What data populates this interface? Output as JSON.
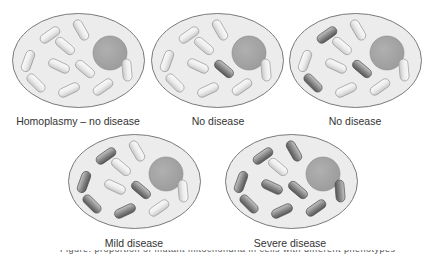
{
  "colors": {
    "cytoplasm": "#ececec",
    "membrane": "#7a7a7a",
    "nucleus": "#9a9a9a",
    "normal_mito": "#ededed",
    "mutant_mito": "#8a8a8a"
  },
  "mito_layout": [
    {
      "cx": 38,
      "cy": 22,
      "angle": -35
    },
    {
      "cx": 69,
      "cy": 17,
      "angle": 60
    },
    {
      "cx": 53,
      "cy": 33,
      "angle": 40
    },
    {
      "cx": 16,
      "cy": 48,
      "angle": -70
    },
    {
      "cx": 47,
      "cy": 53,
      "angle": 25
    },
    {
      "cx": 73,
      "cy": 56,
      "angle": 40
    },
    {
      "cx": 24,
      "cy": 70,
      "angle": 45
    },
    {
      "cx": 57,
      "cy": 77,
      "angle": -25
    },
    {
      "cx": 91,
      "cy": 74,
      "angle": -35
    },
    {
      "cx": 115,
      "cy": 57,
      "angle": 85
    }
  ],
  "cells": [
    {
      "id": "cell-1",
      "x": 12,
      "y": 13,
      "label": "Homoplasmy – no disease",
      "label_x": 78,
      "label_y": 115,
      "mutant": []
    },
    {
      "id": "cell-2",
      "x": 151,
      "y": 13,
      "label": "No disease",
      "label_x": 218,
      "label_y": 115,
      "mutant": [
        5
      ]
    },
    {
      "id": "cell-3",
      "x": 289,
      "y": 13,
      "label": "No disease",
      "label_x": 355,
      "label_y": 115,
      "mutant": [
        0,
        5,
        6
      ]
    },
    {
      "id": "cell-4",
      "x": 68,
      "y": 134,
      "label": "Mild disease",
      "label_x": 134,
      "label_y": 237,
      "mutant": [
        0,
        3,
        5,
        6,
        7
      ]
    },
    {
      "id": "cell-5",
      "x": 225,
      "y": 134,
      "label": "Severe disease",
      "label_x": 290,
      "label_y": 237,
      "mutant": [
        0,
        1,
        3,
        4,
        5,
        6,
        7,
        8,
        9
      ]
    }
  ],
  "footer_text": "Figure: proportion of mutant mitochondria in cells with different phenotypes"
}
